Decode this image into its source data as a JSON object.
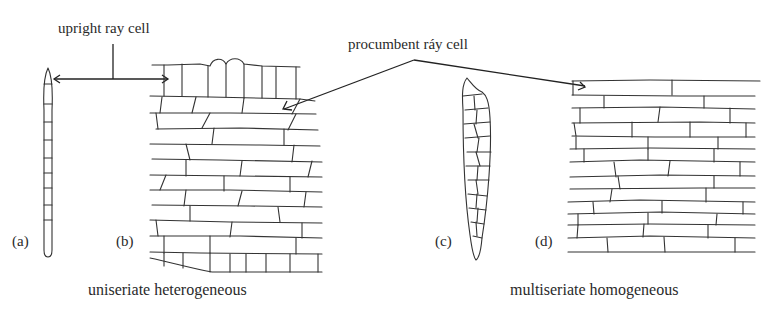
{
  "annotations": {
    "upright": "upright ray cell",
    "procumbent": "procumbent ráy cell"
  },
  "panels": [
    {
      "id": "a",
      "label": "(a)"
    },
    {
      "id": "b",
      "label": "(b)"
    },
    {
      "id": "c",
      "label": "(c)"
    },
    {
      "id": "d",
      "label": "(d)"
    }
  ],
  "captions": {
    "left": "uniseriate heterogeneous",
    "right": "multiseriate homogeneous"
  },
  "colors": {
    "ink": "#333333",
    "background": "#ffffff"
  }
}
